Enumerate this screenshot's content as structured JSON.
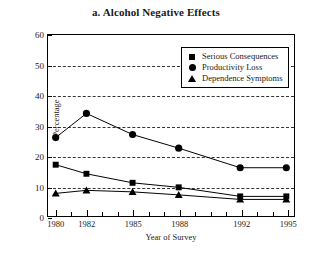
{
  "chart_data": {
    "type": "line",
    "title": "a.  Alcohol Negative Effects",
    "xlabel": "Year of Survey",
    "ylabel": "Percentage",
    "x": [
      1980,
      1982,
      1985,
      1988,
      1992,
      1995
    ],
    "xtick_labels": [
      "1980",
      "1982",
      "1985",
      "1988",
      "1992",
      "1995"
    ],
    "xlim": [
      1979.5,
      1995.5
    ],
    "ylim": [
      0,
      60
    ],
    "ytick_labels": [
      "0",
      "10",
      "20",
      "30",
      "40",
      "50",
      "60"
    ],
    "yticks": [
      0,
      10,
      20,
      30,
      40,
      50,
      60
    ],
    "grid": "horizontal-dashed",
    "legend_position": "top-right",
    "series": [
      {
        "name": "Serious Consequences",
        "marker": "square",
        "values": [
          17.0,
          14.0,
          11.0,
          9.5,
          6.5,
          6.5
        ]
      },
      {
        "name": "Productivity Loss",
        "marker": "circle",
        "values": [
          26.0,
          34.0,
          27.0,
          22.5,
          16.0,
          16.0
        ]
      },
      {
        "name": "Dependence Symptoms",
        "marker": "triangle",
        "values": [
          7.5,
          8.5,
          8.0,
          7.0,
          5.5,
          5.5
        ]
      }
    ]
  },
  "legend": {
    "items": [
      {
        "label": "Serious Consequences",
        "marker": "square"
      },
      {
        "label": "Productivity Loss",
        "marker": "circle"
      },
      {
        "label": "Dependence Symptoms",
        "marker": "triangle"
      }
    ]
  },
  "colors": {
    "ink": "#000000",
    "background": "#ffffff"
  }
}
